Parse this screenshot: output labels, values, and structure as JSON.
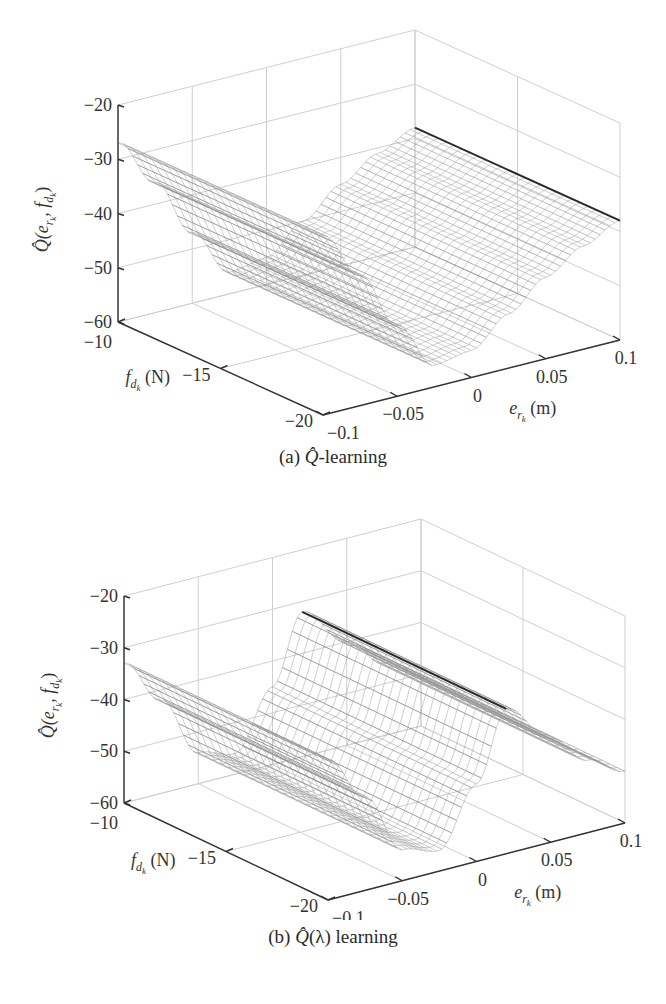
{
  "figure": {
    "panels": [
      {
        "id": "a",
        "caption_prefix": "(a) ",
        "caption_symbol": "Q̂",
        "caption_suffix": "-learning"
      },
      {
        "id": "b",
        "caption_prefix": "(b) ",
        "caption_symbol": "Q̂",
        "caption_suffix": "(λ) learning"
      }
    ]
  },
  "chart_data": [
    {
      "type": "surface",
      "title": "(a) Q̂-learning",
      "xlabel": "e_{r_k} (m)",
      "ylabel": "f_{d_k} (N)",
      "zlabel": "Q̂(e_{r_k}, f_{d_k})",
      "xlim": [
        -0.1,
        0.1
      ],
      "ylim": [
        -20,
        -10
      ],
      "zlim": [
        -60,
        -20
      ],
      "xticks": [
        -0.1,
        -0.05,
        0,
        0.05,
        0.1
      ],
      "xtick_labels": [
        "−0.1",
        "−0.05",
        "0",
        "0.05",
        "0.1"
      ],
      "yticks": [
        -10,
        -15,
        -20
      ],
      "ytick_labels": [
        "−10",
        "−15",
        "−20"
      ],
      "zticks": [
        -20,
        -30,
        -40,
        -50,
        -60
      ],
      "ztick_labels": [
        "−20",
        "−30",
        "−40",
        "−50",
        "−60"
      ],
      "grid": true,
      "colormap": "grayscale mesh",
      "surface_description": "Valley-shaped surface constant along f; quadratic in e with minimum ≈ -58 near e≈-0.03, rising to ≈ -27 at e=-0.1 and ≈ -39 at e=0.1",
      "profile_e": [
        -0.1,
        -0.075,
        -0.05,
        -0.025,
        0,
        0.025,
        0.05,
        0.075,
        0.1
      ],
      "profile_q": [
        -27,
        -36,
        -47,
        -56,
        -55,
        -50,
        -45,
        -41,
        -38
      ]
    },
    {
      "type": "surface",
      "title": "(b) Q̂(λ) learning",
      "xlabel": "e_{r_k} (m)",
      "ylabel": "f_{d_k} (N)",
      "zlabel": "Q̂(e_{r_k}, f_{d_k})",
      "xlim": [
        -0.1,
        0.1
      ],
      "ylim": [
        -20,
        -10
      ],
      "zlim": [
        -60,
        -20
      ],
      "xticks": [
        -0.1,
        -0.05,
        0,
        0.05,
        0.1
      ],
      "xtick_labels": [
        "−0.1",
        "−0.05",
        "0",
        "0.05",
        "0.1"
      ],
      "yticks": [
        -10,
        -15,
        -20
      ],
      "ytick_labels": [
        "−10",
        "−15",
        "−20"
      ],
      "zticks": [
        -20,
        -30,
        -40,
        -50,
        -60
      ],
      "ztick_labels": [
        "−20",
        "−30",
        "−40",
        "−50",
        "−60"
      ],
      "grid": true,
      "colormap": "grayscale mesh",
      "surface_description": "Valley-shaped surface constant along f; minimum ≈ -58 near e≈-0.04, rising to ≈ -33 at e=-0.1 and a sharp ridge ≈ -30 at e≈0.02",
      "profile_e": [
        -0.1,
        -0.075,
        -0.05,
        -0.025,
        0,
        0.02,
        0.05,
        0.075,
        0.1
      ],
      "profile_q": [
        -33,
        -42,
        -54,
        -56,
        -45,
        -32,
        -40,
        -46,
        -50
      ]
    }
  ],
  "styles": {
    "axis_color": "#333333",
    "grid_color": "#cfcfcf",
    "mesh_dark": "#3a3a3a",
    "mesh_light": "#d8d8d8"
  }
}
